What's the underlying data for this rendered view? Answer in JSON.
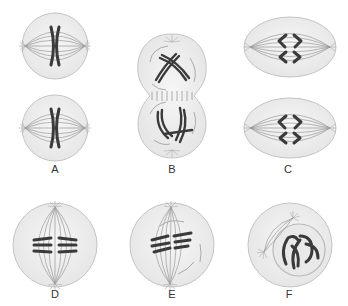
{
  "diagram": {
    "panels": [
      {
        "id": "A",
        "label": "A",
        "description": "two daughter cells, each with a chromosome aligned at spindle equator"
      },
      {
        "id": "B",
        "label": "B",
        "description": "dividing cell with two lobes, chromosomes condensing, cell plate forming"
      },
      {
        "id": "C",
        "label": "C",
        "description": "two elliptical cells with chromosomes separating toward poles"
      },
      {
        "id": "D",
        "label": "D",
        "description": "cell with paired chromosomes aligned at spindle equator"
      },
      {
        "id": "E",
        "label": "E",
        "description": "cell with paired chromosomes near equator, spindle forming"
      },
      {
        "id": "F",
        "label": "F",
        "description": "cell with condensed chromosomes in nucleus, asters migrating"
      }
    ]
  },
  "colors": {
    "background": "#ffffff",
    "cell_fill": "#eeeeee",
    "cell_outline": "#bbbbbb",
    "spindle": "#999999",
    "chromosome": "#3a3a3a",
    "label": "#333333"
  }
}
